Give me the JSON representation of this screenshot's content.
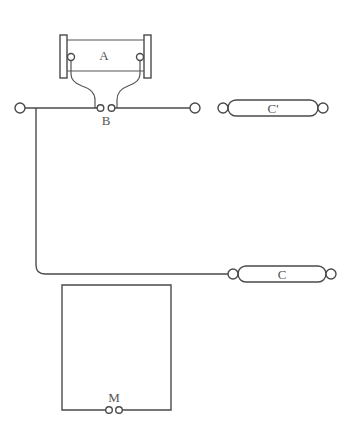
{
  "diagram": {
    "type": "circuit-schematic",
    "labels": {
      "a": "A",
      "b": "B",
      "c_prime": "C'",
      "c": "C",
      "m": "M"
    },
    "components": [
      {
        "id": "A",
        "description": "device between two vertical plates with two terminals"
      },
      {
        "id": "B",
        "description": "pair of terminals on main horizontal line"
      },
      {
        "id": "C'",
        "description": "capsule element with terminals at both ends"
      },
      {
        "id": "C",
        "description": "capsule element with terminals at both ends, connected via branch from left"
      },
      {
        "id": "M",
        "description": "rectangular loop with pair of terminals at bottom"
      }
    ],
    "colors": {
      "line": "#4a4a4a",
      "background": "#ffffff",
      "text": "#555555"
    }
  }
}
